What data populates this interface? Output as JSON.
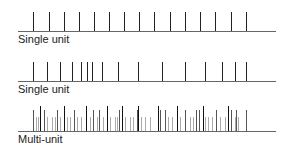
{
  "rows": [
    {
      "label": "Single unit",
      "baseline_y": 31,
      "label_top": 33,
      "spikes": [
        {
          "x": 33,
          "top": 12,
          "c": "#222"
        },
        {
          "x": 49,
          "top": 12,
          "c": "#222"
        },
        {
          "x": 64,
          "top": 12,
          "c": "#222"
        },
        {
          "x": 79,
          "top": 12,
          "c": "#222"
        },
        {
          "x": 94,
          "top": 12,
          "c": "#222"
        },
        {
          "x": 109,
          "top": 12,
          "c": "#222"
        },
        {
          "x": 124,
          "top": 12,
          "c": "#222"
        },
        {
          "x": 139,
          "top": 12,
          "c": "#222"
        },
        {
          "x": 154,
          "top": 12,
          "c": "#222"
        },
        {
          "x": 170,
          "top": 12,
          "c": "#222"
        },
        {
          "x": 185,
          "top": 12,
          "c": "#222"
        },
        {
          "x": 200,
          "top": 12,
          "c": "#222"
        },
        {
          "x": 215,
          "top": 12,
          "c": "#222"
        },
        {
          "x": 231,
          "top": 12,
          "c": "#222"
        },
        {
          "x": 246,
          "top": 12,
          "c": "#222"
        }
      ]
    },
    {
      "label": "Single unit",
      "baseline_y": 81,
      "label_top": 83,
      "spikes": [
        {
          "x": 33,
          "top": 62,
          "c": "#222"
        },
        {
          "x": 47,
          "top": 62,
          "c": "#222"
        },
        {
          "x": 60,
          "top": 62,
          "c": "#222"
        },
        {
          "x": 72,
          "top": 62,
          "c": "#222"
        },
        {
          "x": 81,
          "top": 62,
          "c": "#222"
        },
        {
          "x": 87,
          "top": 62,
          "c": "#222"
        },
        {
          "x": 92,
          "top": 62,
          "c": "#222"
        },
        {
          "x": 102,
          "top": 62,
          "c": "#222"
        },
        {
          "x": 118,
          "top": 62,
          "c": "#222"
        },
        {
          "x": 138,
          "top": 62,
          "c": "#222"
        },
        {
          "x": 162,
          "top": 62,
          "c": "#222"
        },
        {
          "x": 185,
          "top": 62,
          "c": "#222"
        },
        {
          "x": 205,
          "top": 62,
          "c": "#222"
        },
        {
          "x": 222,
          "top": 62,
          "c": "#222"
        },
        {
          "x": 235,
          "top": 62,
          "c": "#222"
        },
        {
          "x": 246,
          "top": 62,
          "c": "#222"
        }
      ]
    },
    {
      "label": "Multi-unit",
      "baseline_y": 131,
      "label_top": 133,
      "spikes": [
        {
          "x": 36,
          "top": 117,
          "c": "#aaa"
        },
        {
          "x": 38,
          "top": 117,
          "c": "#aaa"
        },
        {
          "x": 47,
          "top": 117,
          "c": "#aaa"
        },
        {
          "x": 52,
          "top": 117,
          "c": "#aaa"
        },
        {
          "x": 55,
          "top": 117,
          "c": "#aaa"
        },
        {
          "x": 60,
          "top": 117,
          "c": "#aaa"
        },
        {
          "x": 67,
          "top": 117,
          "c": "#aaa"
        },
        {
          "x": 70,
          "top": 117,
          "c": "#aaa"
        },
        {
          "x": 77,
          "top": 117,
          "c": "#aaa"
        },
        {
          "x": 81,
          "top": 117,
          "c": "#aaa"
        },
        {
          "x": 90,
          "top": 117,
          "c": "#aaa"
        },
        {
          "x": 97,
          "top": 117,
          "c": "#aaa"
        },
        {
          "x": 103,
          "top": 117,
          "c": "#aaa"
        },
        {
          "x": 110,
          "top": 117,
          "c": "#aaa"
        },
        {
          "x": 115,
          "top": 117,
          "c": "#aaa"
        },
        {
          "x": 117,
          "top": 117,
          "c": "#aaa"
        },
        {
          "x": 125,
          "top": 117,
          "c": "#aaa"
        },
        {
          "x": 130,
          "top": 117,
          "c": "#aaa"
        },
        {
          "x": 133,
          "top": 117,
          "c": "#aaa"
        },
        {
          "x": 141,
          "top": 117,
          "c": "#aaa"
        },
        {
          "x": 145,
          "top": 117,
          "c": "#aaa"
        },
        {
          "x": 150,
          "top": 117,
          "c": "#aaa"
        },
        {
          "x": 168,
          "top": 117,
          "c": "#aaa"
        },
        {
          "x": 172,
          "top": 117,
          "c": "#aaa"
        },
        {
          "x": 180,
          "top": 117,
          "c": "#aaa"
        },
        {
          "x": 190,
          "top": 117,
          "c": "#aaa"
        },
        {
          "x": 193,
          "top": 117,
          "c": "#aaa"
        },
        {
          "x": 205,
          "top": 117,
          "c": "#aaa"
        },
        {
          "x": 208,
          "top": 117,
          "c": "#aaa"
        },
        {
          "x": 212,
          "top": 117,
          "c": "#aaa"
        },
        {
          "x": 220,
          "top": 117,
          "c": "#aaa"
        },
        {
          "x": 225,
          "top": 117,
          "c": "#aaa"
        },
        {
          "x": 235,
          "top": 117,
          "c": "#aaa"
        },
        {
          "x": 238,
          "top": 117,
          "c": "#aaa"
        },
        {
          "x": 33,
          "top": 110,
          "c": "#555"
        },
        {
          "x": 44,
          "top": 110,
          "c": "#555"
        },
        {
          "x": 57,
          "top": 110,
          "c": "#555"
        },
        {
          "x": 74,
          "top": 110,
          "c": "#555"
        },
        {
          "x": 93,
          "top": 110,
          "c": "#555"
        },
        {
          "x": 99,
          "top": 110,
          "c": "#555"
        },
        {
          "x": 119,
          "top": 110,
          "c": "#555"
        },
        {
          "x": 137,
          "top": 110,
          "c": "#555"
        },
        {
          "x": 160,
          "top": 110,
          "c": "#555"
        },
        {
          "x": 165,
          "top": 110,
          "c": "#555"
        },
        {
          "x": 185,
          "top": 110,
          "c": "#555"
        },
        {
          "x": 196,
          "top": 110,
          "c": "#555"
        },
        {
          "x": 199,
          "top": 110,
          "c": "#555"
        },
        {
          "x": 216,
          "top": 110,
          "c": "#555"
        },
        {
          "x": 231,
          "top": 110,
          "c": "#555"
        },
        {
          "x": 236,
          "top": 110,
          "c": "#555"
        },
        {
          "x": 246,
          "top": 110,
          "c": "#555"
        },
        {
          "x": 40,
          "top": 106,
          "c": "#111"
        },
        {
          "x": 64,
          "top": 106,
          "c": "#111"
        },
        {
          "x": 86,
          "top": 106,
          "c": "#111"
        },
        {
          "x": 107,
          "top": 106,
          "c": "#111"
        },
        {
          "x": 122,
          "top": 106,
          "c": "#111"
        },
        {
          "x": 138,
          "top": 106,
          "c": "#111"
        },
        {
          "x": 158,
          "top": 106,
          "c": "#111"
        },
        {
          "x": 177,
          "top": 106,
          "c": "#111"
        },
        {
          "x": 203,
          "top": 106,
          "c": "#111"
        },
        {
          "x": 228,
          "top": 106,
          "c": "#111"
        }
      ]
    }
  ],
  "axis": {
    "x_start": 18,
    "x_end": 276,
    "color": "#666"
  }
}
